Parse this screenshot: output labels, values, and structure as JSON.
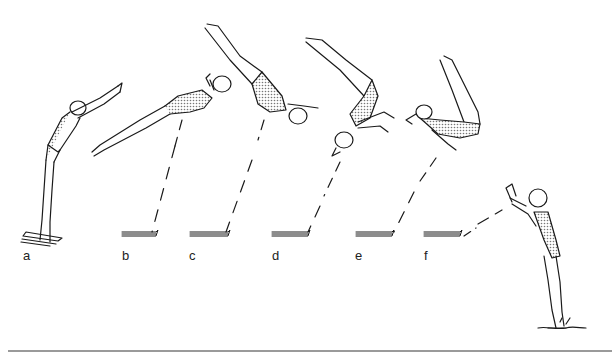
{
  "figure": {
    "stage_labels": [
      "a",
      "b",
      "c",
      "d",
      "e",
      "f"
    ],
    "colors": {
      "ink": "#1a1a1a",
      "suit_shade": "#9a9a9a",
      "rule": "#9a9a9a",
      "background": "#ffffff"
    }
  }
}
